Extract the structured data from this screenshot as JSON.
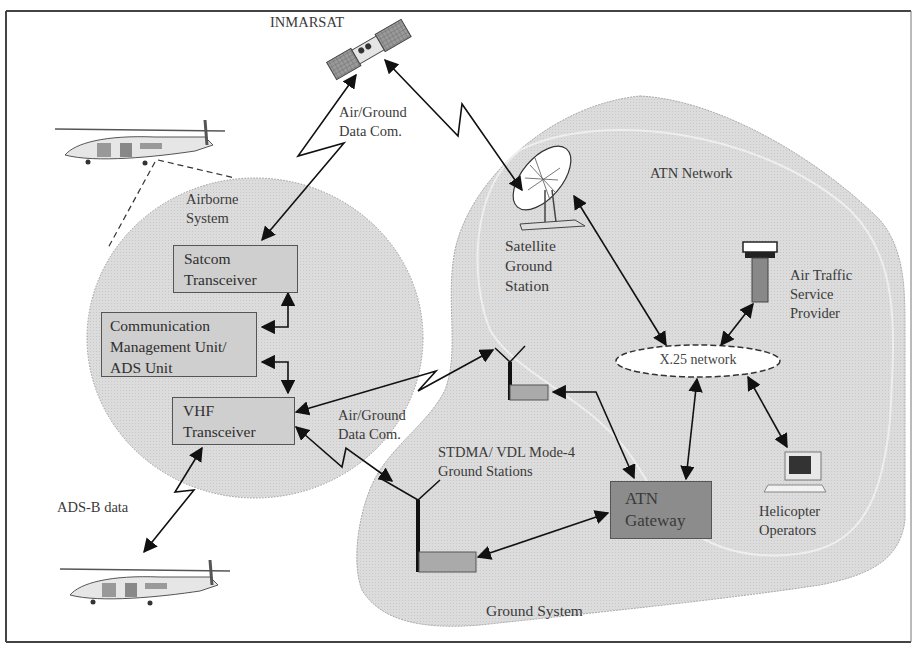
{
  "diagram": {
    "title_satellite": "INMARSAT",
    "colors": {
      "frame": "#444444",
      "region_fill": "#d9d9d9",
      "box_fill": "#cfcfcf",
      "gateway_fill": "#8c8c8c",
      "arrow": "#111111"
    },
    "regions": {
      "airborne": {
        "label": "Airborne\nSystem"
      },
      "atn_network": {
        "label": "ATN Network"
      },
      "ground_system": {
        "label": "Ground System"
      }
    },
    "components": {
      "satcom": {
        "label": "Satcom\nTransceiver"
      },
      "cmu": {
        "label": "Communication\nManagement Unit/\nADS Unit"
      },
      "vhf": {
        "label": "VHF\nTransceiver"
      },
      "satellite_ground_station": {
        "label": "Satellite\nGround\nStation"
      },
      "atsp": {
        "label": "Air Traffic\nService\nProvider"
      },
      "x25": {
        "label": "X.25 network"
      },
      "stdma": {
        "label": "STDMA/ VDL Mode-4\nGround Stations"
      },
      "atn_gateway": {
        "label": "ATN\nGateway"
      },
      "helicopter_operators": {
        "label": "Helicopter\nOperators"
      }
    },
    "links": {
      "sat_air_ground": {
        "label": "Air/Ground\nData Com."
      },
      "vhf_air_ground": {
        "label": "Air/Ground\nData Com."
      },
      "adsb": {
        "label": "ADS-B data"
      }
    },
    "icons": [
      "satellite-icon",
      "helicopter-icon",
      "satellite-dish-icon",
      "control-tower-icon",
      "antenna-icon",
      "computer-icon"
    ]
  }
}
